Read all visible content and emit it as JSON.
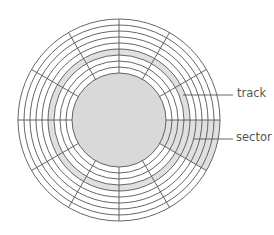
{
  "diagram": {
    "type": "disk-platter",
    "center": [
      119,
      120
    ],
    "outer_radius": 101,
    "hub_radius": 47,
    "track_count": 9,
    "sector_count": 12,
    "highlighted_track_index": 3,
    "highlighted_sector": {
      "start_deg": 0,
      "end_deg": 30
    },
    "colors": {
      "line": "#555555",
      "hub_fill": "#d9d9d9",
      "highlight_fill": "#e0e0e0",
      "background": "#ffffff"
    }
  },
  "labels": {
    "track": "track",
    "sector": "sector"
  }
}
